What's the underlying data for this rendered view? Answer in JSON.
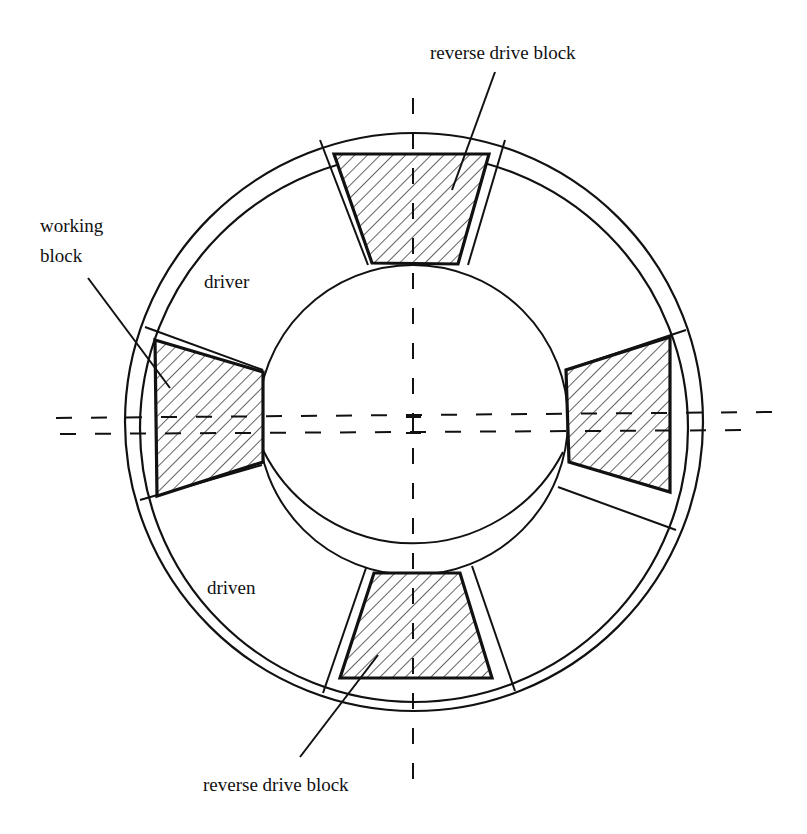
{
  "diagram": {
    "type": "mechanical cross-section",
    "labels": {
      "reverse_drive_top": "reverse drive block",
      "working_block_line1": "working",
      "working_block_line2": "block",
      "driver": "driver",
      "driven": "driven",
      "reverse_drive_bottom": "reverse drive block"
    },
    "colors": {
      "stroke": "#111111",
      "background": "#ffffff",
      "hatch": "#222222"
    },
    "geometry": {
      "center": [
        413,
        422
      ],
      "outer_ring_radius": 289,
      "outer_ring_inner_radius": 276,
      "hub_radius": 155,
      "hub_outer_lower_radius": 170
    },
    "blocks": [
      {
        "name": "top reverse drive block",
        "position": "top"
      },
      {
        "name": "left working block",
        "position": "left"
      },
      {
        "name": "right block",
        "position": "right"
      },
      {
        "name": "bottom reverse drive block",
        "position": "bottom"
      }
    ]
  }
}
